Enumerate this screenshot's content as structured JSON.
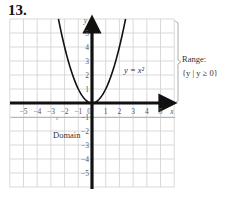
{
  "problem_number": "13.",
  "graph": {
    "equation_label": "y = x²",
    "x_axis_label": "x",
    "y_axis_label": "y",
    "x_ticks": [
      "−5",
      "−4",
      "−3",
      "−2",
      "−1",
      "0",
      "1",
      "2",
      "3",
      "4",
      "5"
    ],
    "y_ticks_positive": [
      "1",
      "2",
      "3",
      "4",
      "5"
    ],
    "y_ticks_negative": [
      "−1",
      "−2",
      "−3",
      "−4",
      "−5"
    ],
    "x_range": [
      -6,
      6
    ],
    "y_range": [
      -6,
      6
    ],
    "grid": true
  },
  "annotations": {
    "range_title": "Range:",
    "range_set": "{y | y ≥ 0}",
    "domain_label": "Domain"
  },
  "colors": {
    "grid": "#cfcfcf",
    "axis": "#111111",
    "curve": "#111111",
    "text": "#333333"
  }
}
